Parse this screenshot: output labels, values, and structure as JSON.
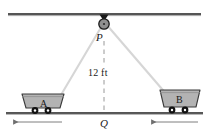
{
  "figure": {
    "background_color": "#ffffff"
  },
  "colors": {
    "rail": "#1c1c1c",
    "ground": "#1c1c1c",
    "rope": "#d8d8d8",
    "dashed": "#8c8c8c",
    "cart_body": "#b3b3b3",
    "cart_outline": "#3a3a3a",
    "wheel": "#111111",
    "pulley_fill": "#8f8f8f",
    "pulley_outline": "#1a1a1a",
    "text": "#1a1a1a"
  },
  "labels": {
    "pulley_point": "P",
    "ground_point": "Q",
    "height_measure": "12 ft",
    "cart_left": "A",
    "cart_right": "B"
  },
  "icons": {
    "pulley": "pulley-icon",
    "hook": "ceiling-hook-icon",
    "cart_left": "mine-cart-icon",
    "cart_right": "mine-cart-icon",
    "arrow_left": "arrow-left-icon",
    "arrow_right": "arrow-left-icon"
  },
  "geometry": {
    "top_rail_y": 14,
    "ground_y": 113,
    "pulley_center": {
      "x": 104,
      "y": 22
    },
    "ground_point_q": {
      "x": 104,
      "y": 113
    },
    "vertical_distance_label": "12 ft",
    "cart_a_center": {
      "x": 42,
      "y": 104
    },
    "cart_b_center": {
      "x": 178,
      "y": 100
    },
    "motion_direction_a": "left",
    "motion_direction_b": "left"
  }
}
